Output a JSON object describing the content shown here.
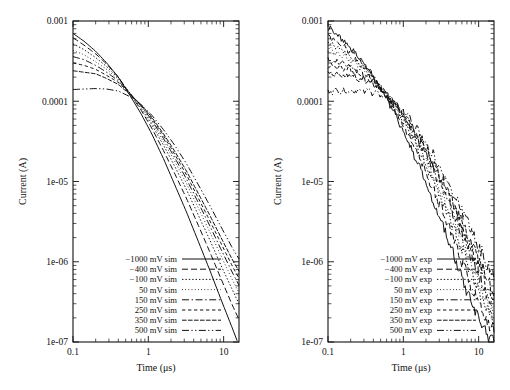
{
  "figure": {
    "panels": [
      {
        "id": "left",
        "kind": "simulation",
        "xlabel": "Time (μs)",
        "ylabel": "Current (A)",
        "xticklabels": [
          "0.1",
          "1",
          "10"
        ],
        "yticklabels": [
          "0.001",
          "0.0001",
          "1e-05",
          "1e-06",
          "1e-07"
        ],
        "legend": [
          "−1000 mV sim",
          "−400 mV sim",
          "−100 mV sim",
          "50 mV sim",
          "150 mV sim",
          "250 mV sim",
          "350 mV sim",
          "500 mV sim"
        ]
      },
      {
        "id": "right",
        "kind": "experiment",
        "xlabel": "Time (μs)",
        "ylabel": "Current (A)",
        "xticklabels": [
          "0.1",
          "1",
          "10"
        ],
        "yticklabels": [
          "0.001",
          "0.0001",
          "1e-05",
          "1e-06",
          "1e-07"
        ],
        "legend": [
          "−1000 mV exp",
          "−400 mV exp",
          "−100 mV exp",
          "50 mV exp",
          "150 mV exp",
          "250 mV exp",
          "350 mV exp",
          "500 mV exp"
        ]
      }
    ]
  },
  "chart_data": [
    {
      "type": "line",
      "title": "",
      "subtitle": "simulated transient current decay",
      "xlabel": "Time (μs)",
      "ylabel": "Current (A)",
      "xscale": "log",
      "yscale": "log",
      "xlim": [
        0.1,
        16
      ],
      "ylim": [
        1e-07,
        0.001
      ],
      "xticks": [
        0.1,
        1,
        10
      ],
      "yticks": [
        0.001,
        0.0001,
        1e-05,
        1e-06,
        1e-07
      ],
      "grid": false,
      "legend_position": "lower-left",
      "x": [
        0.1,
        0.14,
        0.2,
        0.28,
        0.4,
        0.55,
        0.8,
        1.1,
        1.6,
        2.2,
        3.2,
        4.5,
        6.5,
        9.0,
        13.0,
        16.0
      ],
      "series": [
        {
          "name": "−1000 mV sim",
          "dash": "solid",
          "values": [
            0.0007,
            0.00056,
            0.00042,
            0.0003,
            0.0002,
            0.000125,
            7e-05,
            4e-05,
            1.9e-05,
            9.5e-06,
            4.2e-06,
            1.9e-06,
            8e-07,
            3.6e-07,
            1.5e-07,
            9e-08
          ]
        },
        {
          "name": "−400 mV sim",
          "dash": "dashed",
          "values": [
            0.00062,
            0.0005,
            0.00039,
            0.00029,
            0.0002,
            0.00013,
            7.8e-05,
            4.7e-05,
            2.4e-05,
            1.3e-05,
            6.2e-06,
            3e-06,
            1.35e-06,
            6.5e-07,
            2.9e-07,
            1.9e-07
          ]
        },
        {
          "name": "−100 mV sim",
          "dash": "dotted",
          "values": [
            0.00052,
            0.00044,
            0.00035,
            0.00027,
            0.000195,
            0.000132,
            8.2e-05,
            5.2e-05,
            2.8e-05,
            1.6e-05,
            8e-06,
            4e-06,
            1.9e-06,
            9.5e-07,
            4.5e-07,
            3e-07
          ]
        },
        {
          "name": "50 mV sim",
          "dash": "fine-dotted",
          "values": [
            0.00043,
            0.00038,
            0.00031,
            0.00025,
            0.000188,
            0.000132,
            8.6e-05,
            5.6e-05,
            3.1e-05,
            1.85e-05,
            9.5e-06,
            4.9e-06,
            2.4e-06,
            1.25e-06,
            6e-07,
            4.1e-07
          ]
        },
        {
          "name": "150 mV sim",
          "dash": "dash-dot",
          "values": [
            0.00036,
            0.00033,
            0.00028,
            0.00023,
            0.00018,
            0.00013,
            8.8e-05,
            5.9e-05,
            3.4e-05,
            2.05e-05,
            1.08e-05,
            5.7e-06,
            2.85e-06,
            1.5e-06,
            7.4e-07,
            5.1e-07
          ]
        },
        {
          "name": "250 mV sim",
          "dash": "short-dash",
          "values": [
            0.0003,
            0.00028,
            0.00025,
            0.00021,
            0.000172,
            0.000128,
            9e-05,
            6.2e-05,
            3.7e-05,
            2.25e-05,
            1.22e-05,
            6.5e-06,
            3.3e-06,
            1.78e-06,
            8.9e-07,
            6.2e-07
          ]
        },
        {
          "name": "350 mV sim",
          "dash": "dense-dash",
          "values": [
            0.00024,
            0.00023,
            0.00022,
            0.000192,
            0.000162,
            0.000125,
            9.1e-05,
            6.4e-05,
            3.9e-05,
            2.45e-05,
            1.36e-05,
            7.4e-06,
            3.85e-06,
            2.1e-06,
            1.07e-06,
            7.6e-07
          ]
        },
        {
          "name": "500 mV sim",
          "dash": "dash-dot-dot",
          "values": [
            0.00014,
            0.000142,
            0.000144,
            0.000142,
            0.000134,
            0.000116,
            9.1e-05,
            6.8e-05,
            4.4e-05,
            2.9e-05,
            1.68e-05,
            9.5e-06,
            5.1e-06,
            2.85e-06,
            1.5e-06,
            1.08e-06
          ]
        }
      ]
    },
    {
      "type": "line",
      "title": "",
      "subtitle": "experimental transient current decay",
      "xlabel": "Time (μs)",
      "ylabel": "Current (A)",
      "xscale": "log",
      "yscale": "log",
      "xlim": [
        0.1,
        16
      ],
      "ylim": [
        1e-07,
        0.001
      ],
      "xticks": [
        0.1,
        1,
        10
      ],
      "yticks": [
        0.001,
        0.0001,
        1e-05,
        1e-06,
        1e-07
      ],
      "grid": false,
      "legend_position": "lower-left",
      "x": [
        0.1,
        0.14,
        0.2,
        0.28,
        0.4,
        0.55,
        0.8,
        1.1,
        1.6,
        2.2,
        3.2,
        4.5,
        6.5,
        9.0,
        13.0,
        16.0
      ],
      "series": [
        {
          "name": "−1000 mV exp",
          "dash": "solid",
          "values": [
            0.00082,
            0.00064,
            0.00046,
            0.00032,
            0.000205,
            0.000125,
            6.6e-05,
            3.6e-05,
            1.55e-05,
            7.6e-06,
            3.1e-06,
            1.3e-06,
            5e-07,
            2.2e-07,
            1.15e-07,
            1.05e-07
          ]
        },
        {
          "name": "−400 mV exp",
          "dash": "dashed",
          "values": [
            0.00066,
            0.00054,
            0.00041,
            0.0003,
            0.0002,
            0.000128,
            7.4e-05,
            4.3e-05,
            2.05e-05,
            1.05e-05,
            4.6e-06,
            2.05e-06,
            8.5e-07,
            3.8e-07,
            1.7e-07,
            1.35e-07
          ]
        },
        {
          "name": "−100 mV exp",
          "dash": "dotted",
          "values": [
            0.00054,
            0.00046,
            0.00037,
            0.00028,
            0.000196,
            0.000132,
            8e-05,
            4.9e-05,
            2.45e-05,
            1.32e-05,
            6e-06,
            2.8e-06,
            1.2e-06,
            5.4e-07,
            2.4e-07,
            1.75e-07
          ]
        },
        {
          "name": "50 mV exp",
          "dash": "fine-dotted",
          "values": [
            0.00044,
            0.00039,
            0.00033,
            0.00026,
            0.00019,
            0.000134,
            8.5e-05,
            5.4e-05,
            2.8e-05,
            1.55e-05,
            7.3e-06,
            3.5e-06,
            1.55e-06,
            7e-07,
            3.1e-07,
            2.2e-07
          ]
        },
        {
          "name": "150 mV exp",
          "dash": "dash-dot",
          "values": [
            0.00033,
            0.00031,
            0.00027,
            0.00023,
            0.000182,
            0.000133,
            8.9e-05,
            5.8e-05,
            3.1e-05,
            1.78e-05,
            8.6e-06,
            4.2e-06,
            1.9e-06,
            8.8e-07,
            4e-07,
            2.85e-07
          ]
        },
        {
          "name": "250 mV exp",
          "dash": "short-dash",
          "values": [
            0.00028,
            0.000265,
            0.00024,
            0.00021,
            0.000174,
            0.000131,
            9.1e-05,
            6.1e-05,
            3.35e-05,
            1.98e-05,
            9.8e-06,
            4.9e-06,
            2.25e-06,
            1.06e-06,
            4.9e-07,
            3.5e-07
          ]
        },
        {
          "name": "350 mV exp",
          "dash": "dense-dash",
          "values": [
            0.00022,
            0.000215,
            0.000205,
            0.000188,
            0.000162,
            0.000128,
            9.2e-05,
            6.4e-05,
            3.6e-05,
            2.2e-05,
            1.12e-05,
            5.7e-06,
            2.7e-06,
            1.3e-06,
            6.1e-07,
            4.4e-07
          ]
        },
        {
          "name": "500 mV exp",
          "dash": "dash-dot-dot",
          "values": [
            0.00013,
            0.000133,
            0.000136,
            0.000136,
            0.00013,
            0.000114,
            9e-05,
            6.8e-05,
            4.15e-05,
            2.65e-05,
            1.42e-05,
            7.6e-06,
            3.75e-06,
            1.88e-06,
            9.1e-07,
            6.7e-07
          ]
        }
      ]
    }
  ]
}
